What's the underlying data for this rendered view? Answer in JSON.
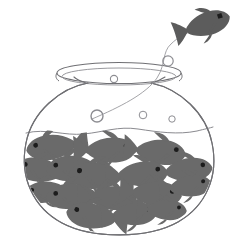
{
  "image": {
    "title": "Crowded fishbowl with one fish jumping out",
    "background_color": "#ffffff",
    "width": 238,
    "height": 244,
    "style": "black-and-white line drawing with gray silhouettes"
  },
  "palette": {
    "outline": "#6f6f73",
    "outline_light": "#9a9a9e",
    "fish_body": "#6a6a6a",
    "fish_body_dark": "#5c5c5c",
    "fish_eye": "#1c1c1c",
    "bubble_stroke": "#8d8d92",
    "water_line": "#8a8a8f",
    "background": "#ffffff"
  },
  "objects": {
    "bowl": {
      "name": "fishbowl",
      "label": "Round glass fishbowl",
      "rim_label": "Bowl rim opening",
      "body_label": "Bowl glass body",
      "stroke_width": 1
    },
    "water": {
      "label": "Water surface line",
      "level_y": 131
    },
    "trajectory": {
      "label": "Jump trajectory line",
      "from": "inside bowl",
      "to": "escaping fish"
    },
    "jumping_fish": {
      "label": "Fish jumping out of the bowl",
      "eye_label": "Fish eye"
    },
    "school_label": "School of fish crowded inside bowl",
    "bubble_label": "Air bubble"
  },
  "counts": {
    "fish_in_bowl": 16,
    "fish_escaping": 1,
    "bubbles": 6
  },
  "bubbles": [
    {
      "id": "bubble-above-rim",
      "cx": 168,
      "cy": 61,
      "r": 5.2
    },
    {
      "id": "bubble-on-rim",
      "cx": 114,
      "cy": 79,
      "r": 3.6
    },
    {
      "id": "bubble-large-inner",
      "cx": 97,
      "cy": 116,
      "r": 6.0
    },
    {
      "id": "bubble-mid-inner",
      "cx": 143,
      "cy": 115,
      "r": 3.8
    },
    {
      "id": "bubble-small-inner",
      "cx": 172,
      "cy": 119,
      "r": 3.2
    },
    {
      "id": "bubble-rim-left",
      "cx": 62,
      "cy": 80,
      "r": 2.4
    }
  ],
  "fish_in_bowl": [
    {
      "id": "fish-1",
      "x": 52,
      "y": 146,
      "scale": 1.0,
      "rot": -8,
      "dir": "left"
    },
    {
      "id": "fish-2",
      "x": 41,
      "y": 164,
      "scale": 0.95,
      "rot": 6,
      "dir": "left"
    },
    {
      "id": "fish-3",
      "x": 68,
      "y": 166,
      "scale": 1.0,
      "rot": -4,
      "dir": "left"
    },
    {
      "id": "fish-4",
      "x": 106,
      "y": 150,
      "scale": 1.0,
      "rot": 0,
      "dir": "right"
    },
    {
      "id": "fish-5",
      "x": 156,
      "y": 152,
      "scale": 1.0,
      "rot": -6,
      "dir": "right"
    },
    {
      "id": "fish-6",
      "x": 176,
      "y": 166,
      "scale": 0.95,
      "rot": 4,
      "dir": "right"
    },
    {
      "id": "fish-7",
      "x": 96,
      "y": 174,
      "scale": 1.05,
      "rot": 3,
      "dir": "left"
    },
    {
      "id": "fish-8",
      "x": 136,
      "y": 172,
      "scale": 1.0,
      "rot": -3,
      "dir": "right"
    },
    {
      "id": "fish-9",
      "x": 60,
      "y": 190,
      "scale": 1.0,
      "rot": -5,
      "dir": "left"
    },
    {
      "id": "fish-10",
      "x": 104,
      "y": 196,
      "scale": 0.95,
      "rot": 2,
      "dir": "left"
    },
    {
      "id": "fish-11",
      "x": 148,
      "y": 192,
      "scale": 1.0,
      "rot": 4,
      "dir": "right"
    },
    {
      "id": "fish-12",
      "x": 172,
      "y": 190,
      "scale": 0.9,
      "rot": -2,
      "dir": "right"
    },
    {
      "id": "fish-13",
      "x": 88,
      "y": 212,
      "scale": 1.0,
      "rot": 8,
      "dir": "left"
    },
    {
      "id": "fish-14",
      "x": 124,
      "y": 210,
      "scale": 0.9,
      "rot": -4,
      "dir": "right"
    },
    {
      "id": "fish-15",
      "x": 46,
      "y": 178,
      "scale": 0.8,
      "rot": 10,
      "dir": "left"
    },
    {
      "id": "fish-16",
      "x": 190,
      "y": 178,
      "scale": 0.8,
      "rot": -8,
      "dir": "right"
    }
  ]
}
